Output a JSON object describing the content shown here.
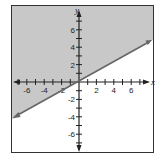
{
  "chart_data": {
    "type": "inequality-graph",
    "title": "",
    "xlabel": "x",
    "ylabel": "y",
    "xlim": [
      -8,
      8
    ],
    "ylim": [
      -8,
      8
    ],
    "x_ticks": [
      -6,
      -4,
      -2,
      2,
      4,
      6
    ],
    "y_ticks": [
      -6,
      -4,
      -2,
      2,
      4,
      6
    ],
    "x_tick_labels": [
      "-6",
      "-4",
      "-2",
      "2",
      "4",
      "6"
    ],
    "y_tick_labels": [
      "-6",
      "-4",
      "-2",
      "2",
      "4",
      "6"
    ],
    "boundary_line": {
      "style": "solid",
      "arrows": "both",
      "points": [
        [
          -7.5,
          -4.1
        ],
        [
          7.9,
          4.7
        ]
      ],
      "approx_slope": 0.57
    },
    "shaded_region": "above line",
    "colors": {
      "shade": "#c8c8c8",
      "line": "#666666",
      "axis": "#222222",
      "frame": "#333333",
      "background": "#ffffff"
    },
    "grid": false
  }
}
